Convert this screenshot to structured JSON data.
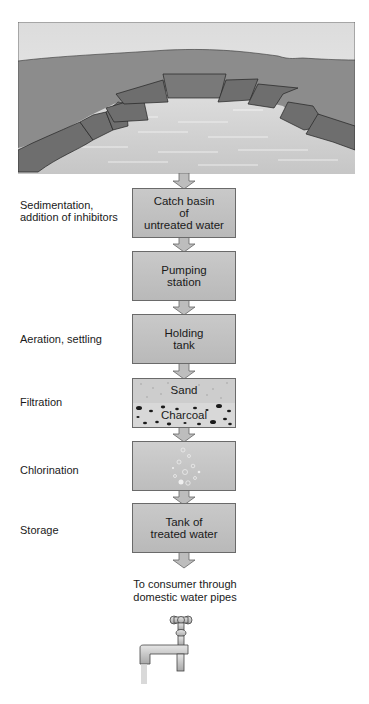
{
  "diagram": {
    "source": "Lake / reservoir landscape illustration",
    "steps": [
      {
        "box": "Catch basin\nof\nuntreated water",
        "process": "Sedimentation,\naddition of inhibitors"
      },
      {
        "box": "Pumping\nstation",
        "process": ""
      },
      {
        "box": "Holding\ntank",
        "process": "Aeration, settling"
      },
      {
        "box": "",
        "process": "Filtration",
        "layers": [
          "Sand",
          "Charcoal"
        ]
      },
      {
        "box": "",
        "process": "Chlorination"
      },
      {
        "box": "Tank of\ntreated water",
        "process": "Storage"
      }
    ],
    "destination": "To consumer through\ndomestic water pipes",
    "icons": [
      "landscape-reservoir",
      "down-arrow",
      "faucet-icon"
    ],
    "colors": {
      "box_fill": "#c0c0c0",
      "box_border": "#6a6a6a",
      "sky": "#e6e6e6",
      "land": "#8f8f8f",
      "water": "#d2d2d2",
      "embankment": "#6e6e6e"
    }
  }
}
